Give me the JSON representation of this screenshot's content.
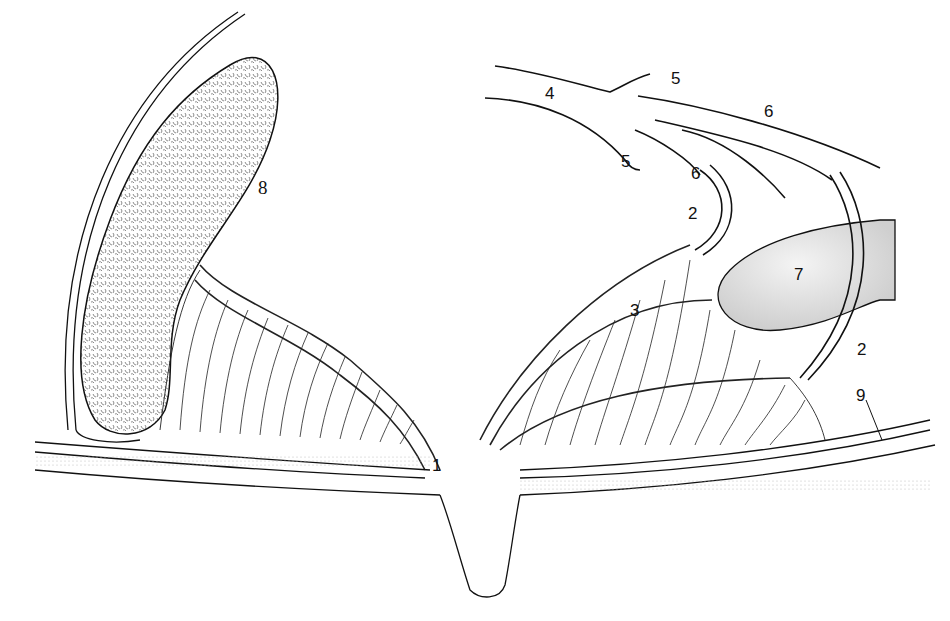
{
  "diagram": {
    "type": "anatomical-line-drawing",
    "colors": {
      "ink": "#111111",
      "stipple": "#9a9a9a",
      "shade": "#d4d4d4",
      "background": "#ffffff"
    },
    "labels": [
      {
        "id": "l1",
        "text": "1",
        "x": 432,
        "y": 457
      },
      {
        "id": "l2a",
        "text": "2",
        "x": 688,
        "y": 205
      },
      {
        "id": "l2b",
        "text": "2",
        "x": 857,
        "y": 341
      },
      {
        "id": "l3",
        "text": "3",
        "x": 630,
        "y": 302
      },
      {
        "id": "l4",
        "text": "4",
        "x": 545,
        "y": 85
      },
      {
        "id": "l5a",
        "text": "5",
        "x": 671,
        "y": 70
      },
      {
        "id": "l5b",
        "text": "5",
        "x": 621,
        "y": 153
      },
      {
        "id": "l6a",
        "text": "6",
        "x": 764,
        "y": 103
      },
      {
        "id": "l6b",
        "text": "6",
        "x": 691,
        "y": 165
      },
      {
        "id": "l7",
        "text": "7",
        "x": 794,
        "y": 266
      },
      {
        "id": "l8",
        "text": "8",
        "x": 258,
        "y": 178
      },
      {
        "id": "l9",
        "text": "9",
        "x": 856,
        "y": 387
      }
    ]
  }
}
